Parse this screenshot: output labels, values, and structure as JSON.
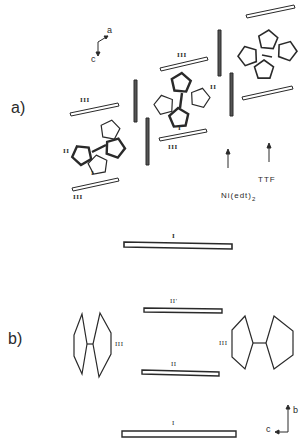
{
  "panels": {
    "a": {
      "label": "a)",
      "axes": {
        "up": "a",
        "down": "c"
      },
      "molecule_labels": {
        "ni": "Ni(edt)",
        "ni_sub": "2",
        "ttf": "TTF"
      },
      "bar_labels": {
        "top_left_bar": "III",
        "mid_bar": "III",
        "lower_bar": "III",
        "mol1_ii": "II",
        "mol1_i": "I",
        "mol2_ii": "II",
        "mol2_i": "I"
      }
    },
    "middle": {
      "bar_label": "I"
    },
    "b": {
      "label": "b)",
      "axes": {
        "up": "b",
        "left": "c"
      },
      "labels": {
        "left_mol": "III",
        "right_mol": "III",
        "top_bar": "II'",
        "mid_bar": "II",
        "bottom_bar": "I"
      }
    }
  },
  "colors": {
    "ink": "#2a2a2a",
    "background": "#ffffff"
  }
}
